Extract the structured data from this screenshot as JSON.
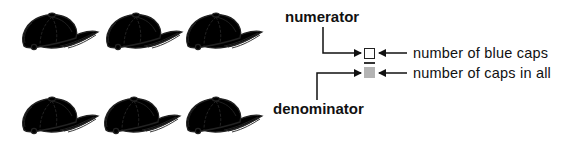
{
  "caps": {
    "total": 6,
    "blue_count": 4,
    "items": [
      {
        "color": "blue",
        "fill": "#8c8c8c"
      },
      {
        "color": "blue",
        "fill": "#8c8c8c"
      },
      {
        "color": "blue",
        "fill": "#8c8c8c"
      },
      {
        "color": "blue",
        "fill": "#8c8c8c"
      },
      {
        "color": "white",
        "fill": "#e6e6e6"
      },
      {
        "color": "white",
        "fill": "#e6e6e6"
      }
    ]
  },
  "fraction": {
    "numerator_label": "numerator",
    "denominator_label": "denominator",
    "numerator_description": "number of blue caps",
    "denominator_description": "number of caps in all",
    "numerator_box_style": "outline",
    "denominator_box_style": "filled",
    "denominator_box_color": "#b4b4b4"
  }
}
